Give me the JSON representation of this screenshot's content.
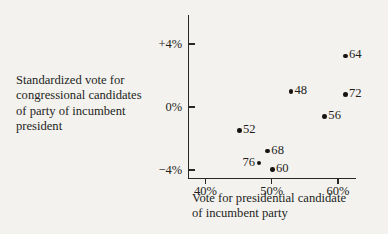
{
  "chart_data": {
    "type": "scatter",
    "title": "",
    "xlabel": "Vote for presidential candidate of incumbent party",
    "ylabel": "Standardized vote for congressional candidates of party of incumbent president",
    "xlim": [
      36,
      66
    ],
    "ylim": [
      -5.1,
      5.2
    ],
    "grid": false,
    "legend": null,
    "xticks": [
      "40%",
      "50%",
      "60%"
    ],
    "xtick_values": [
      40,
      50,
      60
    ],
    "yticks": [
      "+4%",
      "0%",
      "−4%"
    ],
    "ytick_values": [
      4,
      0,
      -4
    ],
    "point_label_note": "Each point is annotated with the two-digit election year",
    "points": [
      {
        "label": "64",
        "x": 61.1,
        "y": 3.25,
        "label_side": "right"
      },
      {
        "label": "72",
        "x": 61.1,
        "y": 0.8,
        "label_side": "right"
      },
      {
        "label": "48",
        "x": 52.9,
        "y": 1.0,
        "label_side": "right"
      },
      {
        "label": "56",
        "x": 58.0,
        "y": -0.6,
        "label_side": "right"
      },
      {
        "label": "52",
        "x": 45.1,
        "y": -1.5,
        "label_side": "right"
      },
      {
        "label": "68",
        "x": 49.4,
        "y": -2.8,
        "label_side": "right"
      },
      {
        "label": "76",
        "x": 48.1,
        "y": -3.55,
        "label_side": "left"
      },
      {
        "label": "60",
        "x": 50.1,
        "y": -3.95,
        "label_side": "right"
      }
    ]
  },
  "axis_titles": {
    "y_lines": [
      "Standardized vote for",
      "congressional candidates",
      "of party of incumbent",
      "president"
    ],
    "x_lines": [
      "Vote for presidential candidate",
      "of incumbent party"
    ]
  },
  "style": {
    "background": "#f4f2ee",
    "ink": "#231f1c",
    "point_color": "#171310"
  }
}
